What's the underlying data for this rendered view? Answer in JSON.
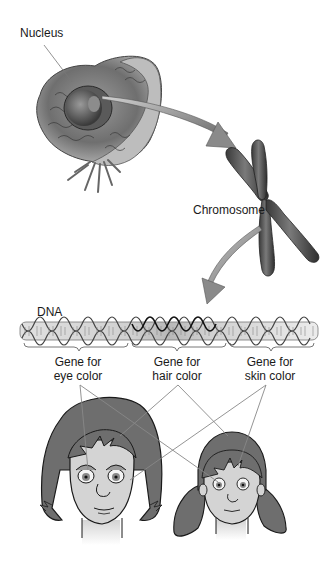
{
  "diagram": {
    "type": "hierarchy",
    "labels": {
      "nucleus": "Nucleus",
      "chromosome": "Chromosome",
      "dna": "DNA"
    },
    "genes": [
      {
        "line1": "Gene for",
        "line2": "eye color"
      },
      {
        "line1": "Gene for",
        "line2": "hair color"
      },
      {
        "line1": "Gene for",
        "line2": "skin color"
      }
    ],
    "people": [
      {
        "name": "adult-woman"
      },
      {
        "name": "girl"
      }
    ],
    "colors": {
      "hair": "#6e6e6e",
      "skin": "#d4d4d4",
      "outline": "#1a1a1a",
      "cell": "#8a8a8a",
      "chromosome": "#555555",
      "arrow": "#8c8c8c",
      "leader_line": "#888888"
    }
  }
}
